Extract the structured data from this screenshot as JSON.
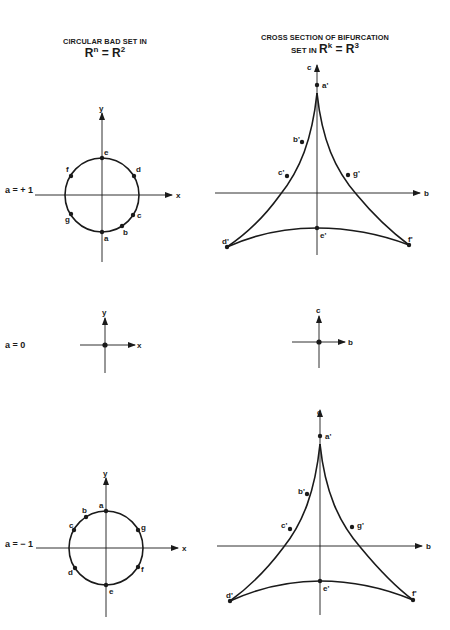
{
  "left_column": {
    "title_line1": "CIRCULAR BAD SET IN",
    "title_line2_base1": "R",
    "title_line2_sup1": "n",
    "title_line2_eq": " = ",
    "title_line2_base2": "R",
    "title_line2_sup2": "2"
  },
  "right_column": {
    "title_line1": "CROSS SECTION OF BIFURCATION",
    "title_line2_prefix": "SET IN ",
    "title_line2_base1": "R",
    "title_line2_sup1": "k",
    "title_line2_eq": " = ",
    "title_line2_base2": "R",
    "title_line2_sup2": "3"
  },
  "rows": [
    {
      "param_label": "a = + 1",
      "circle": {
        "x_axis": "x",
        "y_axis": "y",
        "points": [
          "a",
          "b",
          "c",
          "d",
          "e",
          "f",
          "g"
        ]
      },
      "deltoid": {
        "h_axis": "b",
        "v_axis": "c",
        "points": [
          "a'",
          "b'",
          "c'",
          "d'",
          "e'",
          "f'",
          "g'"
        ]
      }
    },
    {
      "param_label": "a = 0",
      "circle": {
        "x_axis": "x",
        "y_axis": "y"
      },
      "deltoid": {
        "h_axis": "b",
        "v_axis": "c"
      }
    },
    {
      "param_label": "a = − 1",
      "circle": {
        "x_axis": "x",
        "y_axis": "y",
        "points": [
          "a",
          "b",
          "c",
          "d",
          "e",
          "f",
          "g"
        ]
      },
      "deltoid": {
        "h_axis": "b",
        "v_axis": "c",
        "points": [
          "a'",
          "b'",
          "c'",
          "d'",
          "e'",
          "f'",
          "g'"
        ]
      }
    }
  ],
  "labels": {
    "x": "x",
    "y": "y",
    "b": "b",
    "c": "c",
    "a": "a",
    "bb": "b",
    "cc": "c",
    "d": "d",
    "e": "e",
    "f": "f",
    "g": "g",
    "ap": "a'",
    "bp": "b'",
    "cp": "c'",
    "dp": "d'",
    "ep": "e'",
    "fp": "f'",
    "gp": "g'"
  },
  "colors": {
    "ink": "#1a1a1a",
    "paper": "#ffffff"
  }
}
